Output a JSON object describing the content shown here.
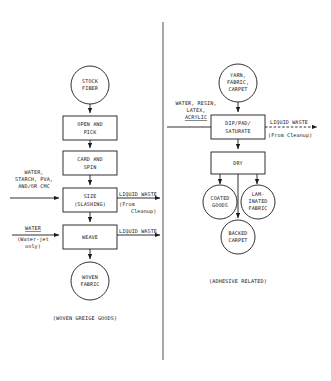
{
  "diagram": {
    "title_left_caption": "(WOVEN GREIGE GOODS)",
    "title_right_caption": "(ADHESIVE RELATED)",
    "left_panel": {
      "start_node": {
        "line1": "STOCK",
        "line2": "FIBER"
      },
      "steps": [
        {
          "line1": "OPEN AND",
          "line2": "PICK"
        },
        {
          "line1": "CARD AND",
          "line2": "SPIN"
        },
        {
          "line1": "SIZE",
          "line2": "(SLASHING)"
        },
        {
          "line1": "WEAVE",
          "line2": ""
        }
      ],
      "end_node": {
        "line1": "WOVEN",
        "line2": "FABRIC"
      },
      "inputs": [
        {
          "line1": "WATER,",
          "line2": "STARCH, PVA,",
          "line3": "AND/OR CMC"
        },
        {
          "line1": "WATER",
          "line2": "(Water-jet",
          "line3": "only)"
        }
      ],
      "outputs": [
        {
          "line1": "LIQUID WASTE",
          "line2": "(From",
          "line3": "Cleanup)"
        },
        {
          "line1": "LIQUID WASTE",
          "line2": "",
          "line3": ""
        }
      ]
    },
    "right_panel": {
      "start_node": {
        "line1": "YARN,",
        "line2": "FABRIC,",
        "line3": "CARPET"
      },
      "steps": [
        {
          "line1": "DIP/PAD/",
          "line2": "SATURATE"
        },
        {
          "line1": "DRY",
          "line2": ""
        }
      ],
      "end_nodes": [
        {
          "line1": "COATED",
          "line2": "GOODS",
          "line3": ""
        },
        {
          "line1": "LAM-",
          "line2": "INATED",
          "line3": "FABRIC"
        },
        {
          "line1": "BACKED",
          "line2": "CARPET",
          "line3": ""
        }
      ],
      "inputs": [
        {
          "line1": "WATER, RESIN,",
          "line2": "LATEX,",
          "line3": "ACRYLIC"
        }
      ],
      "outputs": [
        {
          "line1": "LIQUID WASTE",
          "line2": "(From Cleanup)",
          "line3": ""
        }
      ]
    },
    "colors": {
      "stroke": "#1a1a1a",
      "background": "#ffffff",
      "divider": "#3a3a3a"
    }
  }
}
